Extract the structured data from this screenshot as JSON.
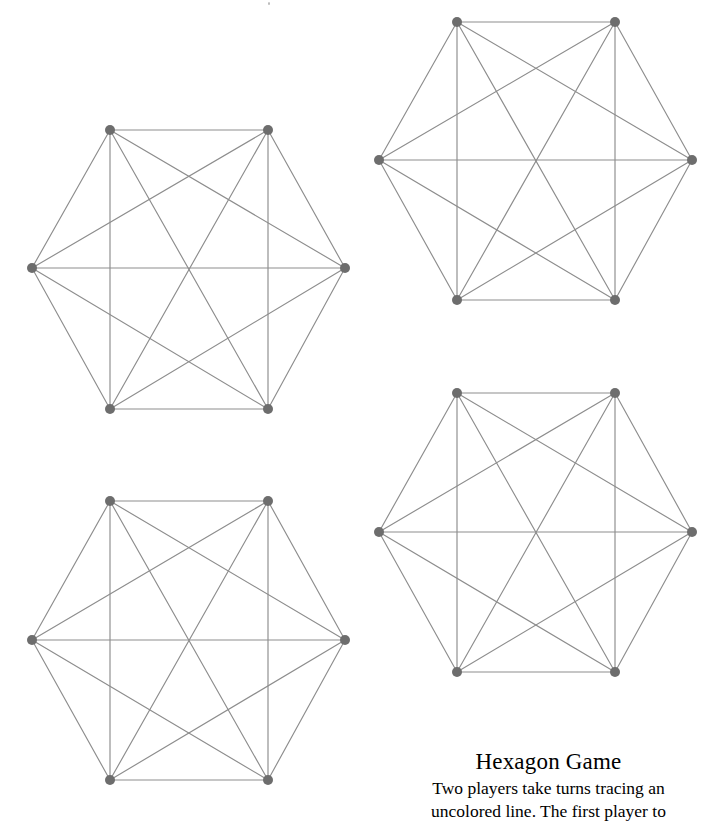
{
  "page": {
    "width": 721,
    "height": 828,
    "background_color": "#ffffff"
  },
  "caption": {
    "title": "Hexagon Game",
    "lines": [
      "Two players take turns tracing an",
      "uncolored line. The first player to"
    ],
    "full_text": "Two players take turns tracing an uncolored line. The first player to"
  },
  "style": {
    "edge_color": "#8d8d8d",
    "vertex_color": "#6d6d6d",
    "vertex_radius": 5,
    "edge_width": 1.15,
    "text_color": "#000000"
  },
  "boards": [
    {
      "name": "hexagon-board-top-left",
      "label": "Top left hexagon game board",
      "left": 0,
      "top": 100,
      "width": 380,
      "height": 340,
      "vertices": [
        {
          "id": 0,
          "label": "top-left",
          "x": 110,
          "y": 130
        },
        {
          "id": 1,
          "label": "top-right",
          "x": 268,
          "y": 130
        },
        {
          "id": 2,
          "label": "right",
          "x": 345,
          "y": 268
        },
        {
          "id": 3,
          "label": "bottom-right",
          "x": 268,
          "y": 409
        },
        {
          "id": 4,
          "label": "bottom-left",
          "x": 110,
          "y": 409
        },
        {
          "id": 5,
          "label": "left",
          "x": 32,
          "y": 268
        }
      ]
    },
    {
      "name": "hexagon-board-top-right",
      "label": "Top right hexagon game board",
      "left": 360,
      "top": 0,
      "width": 380,
      "height": 330,
      "vertices": [
        {
          "id": 0,
          "label": "top-left",
          "x": 457,
          "y": 22
        },
        {
          "id": 1,
          "label": "top-right",
          "x": 615,
          "y": 22
        },
        {
          "id": 2,
          "label": "right",
          "x": 692,
          "y": 160
        },
        {
          "id": 3,
          "label": "bottom-right",
          "x": 615,
          "y": 300
        },
        {
          "id": 4,
          "label": "bottom-left",
          "x": 457,
          "y": 300
        },
        {
          "id": 5,
          "label": "left",
          "x": 379,
          "y": 160
        }
      ]
    },
    {
      "name": "hexagon-board-bottom-left",
      "label": "Bottom left hexagon game board",
      "left": 0,
      "top": 470,
      "width": 380,
      "height": 340,
      "vertices": [
        {
          "id": 0,
          "label": "top-left",
          "x": 110,
          "y": 501
        },
        {
          "id": 1,
          "label": "top-right",
          "x": 268,
          "y": 501
        },
        {
          "id": 2,
          "label": "right",
          "x": 345,
          "y": 640
        },
        {
          "id": 3,
          "label": "bottom-right",
          "x": 268,
          "y": 780
        },
        {
          "id": 4,
          "label": "bottom-left",
          "x": 110,
          "y": 780
        },
        {
          "id": 5,
          "label": "left",
          "x": 32,
          "y": 640
        }
      ]
    },
    {
      "name": "hexagon-board-bottom-right",
      "label": "Bottom right hexagon game board",
      "left": 360,
      "top": 370,
      "width": 380,
      "height": 330,
      "vertices": [
        {
          "id": 0,
          "label": "top-left",
          "x": 457,
          "y": 393
        },
        {
          "id": 1,
          "label": "top-right",
          "x": 615,
          "y": 393
        },
        {
          "id": 2,
          "label": "right",
          "x": 692,
          "y": 532
        },
        {
          "id": 3,
          "label": "bottom-right",
          "x": 615,
          "y": 672
        },
        {
          "id": 4,
          "label": "bottom-left",
          "x": 457,
          "y": 672
        },
        {
          "id": 5,
          "label": "left",
          "x": 379,
          "y": 532
        }
      ]
    }
  ],
  "graph": {
    "type": "complete-graph-k6",
    "vertex_count": 6,
    "edge_count": 15,
    "edges": [
      [
        0,
        1
      ],
      [
        0,
        2
      ],
      [
        0,
        3
      ],
      [
        0,
        4
      ],
      [
        0,
        5
      ],
      [
        1,
        2
      ],
      [
        1,
        3
      ],
      [
        1,
        4
      ],
      [
        1,
        5
      ],
      [
        2,
        3
      ],
      [
        2,
        4
      ],
      [
        2,
        5
      ],
      [
        3,
        4
      ],
      [
        3,
        5
      ],
      [
        4,
        5
      ]
    ]
  }
}
